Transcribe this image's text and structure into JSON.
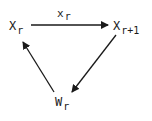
{
  "diagram": {
    "nodes": [
      {
        "id": "Xr",
        "main": "X",
        "sub": "r"
      },
      {
        "id": "Xr1",
        "main": "X",
        "sub": "r+1"
      },
      {
        "id": "Wr",
        "main": "W",
        "sub": "r"
      }
    ],
    "edges": [
      {
        "from": "Xr",
        "to": "Xr1",
        "label_main": "x",
        "label_sub": "r"
      },
      {
        "from": "Xr1",
        "to": "Wr",
        "label_main": "",
        "label_sub": ""
      },
      {
        "from": "Wr",
        "to": "Xr",
        "label_main": "",
        "label_sub": ""
      }
    ],
    "colors": {
      "stroke": "#1a1a1a",
      "background": "#ffffff"
    }
  }
}
